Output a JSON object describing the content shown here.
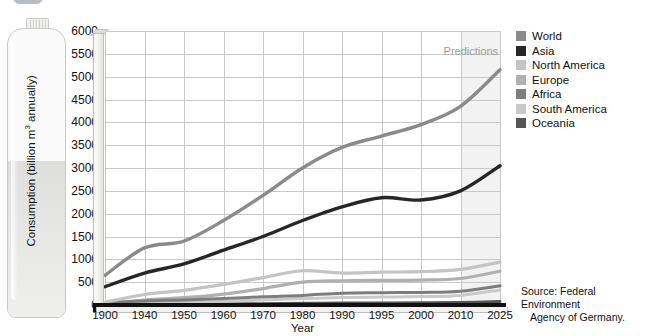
{
  "header": {
    "title": "WATER CONSUMPTION ACROSS THE WORLD: PROJECTED TO 2025",
    "logo_name": "organization-logo"
  },
  "axes": {
    "y_title": "Consumption (billion m",
    "y_title_sup": "3",
    "y_title_tail": " annually)",
    "x_title": "Year",
    "y_ticks": [
      "6000",
      "5500",
      "5000",
      "4500",
      "4000",
      "3500",
      "3000",
      "2500",
      "2000",
      "1500",
      "1000",
      "500",
      "0"
    ],
    "x_ticks": [
      "1900",
      "1940",
      "1950",
      "1960",
      "1970",
      "1980",
      "1990",
      "1995",
      "2000",
      "2010",
      "2025"
    ]
  },
  "annotations": {
    "predictions": "Predictions"
  },
  "source": {
    "line1": "Source: Federal Environment",
    "line2": "Agency of Germany."
  },
  "legend": {
    "items": [
      {
        "label": "World",
        "color": "#8a8a8a"
      },
      {
        "label": "Asia",
        "color": "#262626"
      },
      {
        "label": "North America",
        "color": "#c4c4c4"
      },
      {
        "label": "Europe",
        "color": "#b0b0b0"
      },
      {
        "label": "Africa",
        "color": "#7d7d7d"
      },
      {
        "label": "South America",
        "color": "#c9c9c9"
      },
      {
        "label": "Oceania",
        "color": "#555555"
      }
    ]
  },
  "chart_data": {
    "type": "line",
    "title": "WATER CONSUMPTION ACROSS THE WORLD: PROJECTED TO 2025",
    "xlabel": "Year",
    "ylabel": "Consumption (billion m3 annually)",
    "categories": [
      "1900",
      "1940",
      "1950",
      "1960",
      "1970",
      "1980",
      "1990",
      "1995",
      "2000",
      "2010",
      "2025"
    ],
    "ylim": [
      0,
      6000
    ],
    "ytick_step": 500,
    "grid": true,
    "legend_position": "right",
    "prediction_region": {
      "from": "2010",
      "to": "2025",
      "label": "Predictions"
    },
    "series": [
      {
        "name": "World",
        "color": "#8a8a8a",
        "values": [
          650,
          1250,
          1400,
          1850,
          2400,
          3000,
          3450,
          3700,
          3950,
          4350,
          5150
        ]
      },
      {
        "name": "Asia",
        "color": "#262626",
        "values": [
          400,
          700,
          900,
          1200,
          1500,
          1850,
          2150,
          2350,
          2300,
          2500,
          3050
        ]
      },
      {
        "name": "North America",
        "color": "#c4c4c4",
        "values": [
          60,
          230,
          320,
          450,
          600,
          750,
          700,
          720,
          730,
          780,
          940
        ]
      },
      {
        "name": "Europe",
        "color": "#b0b0b0",
        "values": [
          40,
          110,
          160,
          240,
          360,
          500,
          530,
          540,
          545,
          580,
          740
        ]
      },
      {
        "name": "Africa",
        "color": "#7d7d7d",
        "values": [
          50,
          90,
          110,
          140,
          180,
          210,
          260,
          270,
          275,
          300,
          420
        ]
      },
      {
        "name": "South America",
        "color": "#c9c9c9",
        "values": [
          20,
          45,
          60,
          80,
          110,
          140,
          165,
          175,
          185,
          210,
          330
        ]
      },
      {
        "name": "Oceania",
        "color": "#555555",
        "values": [
          8,
          14,
          18,
          24,
          30,
          36,
          42,
          45,
          48,
          55,
          75
        ]
      }
    ]
  }
}
